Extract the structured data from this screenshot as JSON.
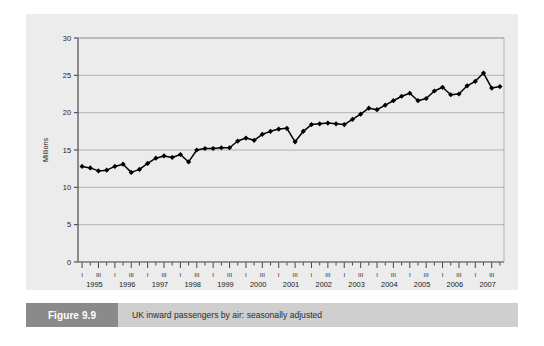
{
  "figure": {
    "caption_number": "Figure 9.9",
    "caption_title": "UK inward passengers by air: seasonally adjusted"
  },
  "chart_data": {
    "type": "line",
    "title": "UK inward passengers by air: seasonally adjusted",
    "xlabel": "",
    "ylabel": "Millions",
    "ylim": [
      0,
      30
    ],
    "yticks": [
      0,
      5,
      10,
      15,
      20,
      25,
      30
    ],
    "grid": "horizontal",
    "legend": "none",
    "marker": "diamond",
    "line_color": "#000000",
    "marker_color": "#000000",
    "panel_color": "#ececec",
    "years": [
      1995,
      1996,
      1997,
      1998,
      1999,
      2000,
      2001,
      2002,
      2003,
      2004,
      2005,
      2006,
      2007
    ],
    "quarter_tick_labels": [
      "I",
      "",
      "III",
      "",
      "I",
      "",
      "III",
      "",
      "I",
      "",
      "III",
      "",
      "I",
      "",
      "III",
      "",
      "I",
      "",
      "III",
      "",
      "I",
      "",
      "III",
      "",
      "I",
      "",
      "III",
      "",
      "I",
      "",
      "III",
      "",
      "I",
      "",
      "III",
      "",
      "I",
      "",
      "III",
      "",
      "I",
      "",
      "III",
      "",
      "I",
      "",
      "III",
      "",
      "I",
      "",
      "III",
      ""
    ],
    "x": [
      "1995 I",
      "1995 II",
      "1995 III",
      "1995 IV",
      "1996 I",
      "1996 II",
      "1996 III",
      "1996 IV",
      "1997 I",
      "1997 II",
      "1997 III",
      "1997 IV",
      "1998 I",
      "1998 II",
      "1998 III",
      "1998 IV",
      "1999 I",
      "1999 II",
      "1999 III",
      "1999 IV",
      "2000 I",
      "2000 II",
      "2000 III",
      "2000 IV",
      "2001 I",
      "2001 II",
      "2001 III",
      "2001 IV",
      "2002 I",
      "2002 II",
      "2002 III",
      "2002 IV",
      "2003 I",
      "2003 II",
      "2003 III",
      "2003 IV",
      "2004 I",
      "2004 II",
      "2004 III",
      "2004 IV",
      "2005 I",
      "2005 II",
      "2005 III",
      "2005 IV",
      "2006 I",
      "2006 II",
      "2006 III",
      "2006 IV",
      "2007 I",
      "2007 II",
      "2007 III",
      "2007 IV"
    ],
    "values": [
      12.8,
      12.6,
      12.2,
      12.3,
      12.8,
      13.1,
      12.0,
      12.4,
      13.2,
      13.9,
      14.2,
      14.0,
      14.4,
      13.4,
      15.0,
      15.2,
      15.2,
      15.3,
      15.3,
      16.2,
      16.6,
      16.3,
      17.1,
      17.5,
      17.8,
      17.9,
      16.1,
      17.5,
      18.4,
      18.5,
      18.6,
      18.5,
      18.4,
      19.1,
      19.8,
      20.6,
      20.4,
      21.0,
      21.6,
      22.2,
      22.6,
      21.6,
      21.9,
      22.9,
      23.4,
      22.4,
      22.5,
      23.6,
      24.2,
      25.3,
      23.3,
      23.5
    ]
  }
}
